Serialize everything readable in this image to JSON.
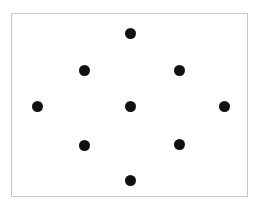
{
  "canvas": {
    "width": 257,
    "height": 210,
    "background_color": "#ffffff"
  },
  "panel": {
    "name": "dot-pattern-frame",
    "left": 11,
    "top": 13,
    "width": 237,
    "height": 184,
    "border_color": "#c9c9c9",
    "border_width": 1,
    "fill_color": "#ffffff"
  },
  "dots": {
    "color": "#111111",
    "diameter": 11,
    "count": 9,
    "items": [
      {
        "label": "top",
        "cx": 130,
        "cy": 33
      },
      {
        "label": "upper-left",
        "cx": 84,
        "cy": 70
      },
      {
        "label": "upper-right",
        "cx": 179,
        "cy": 70
      },
      {
        "label": "left",
        "cx": 37,
        "cy": 106
      },
      {
        "label": "center",
        "cx": 130,
        "cy": 106
      },
      {
        "label": "right",
        "cx": 224,
        "cy": 106
      },
      {
        "label": "lower-left",
        "cx": 84,
        "cy": 145
      },
      {
        "label": "lower-right",
        "cx": 179,
        "cy": 144
      },
      {
        "label": "bottom",
        "cx": 130,
        "cy": 180
      }
    ]
  }
}
